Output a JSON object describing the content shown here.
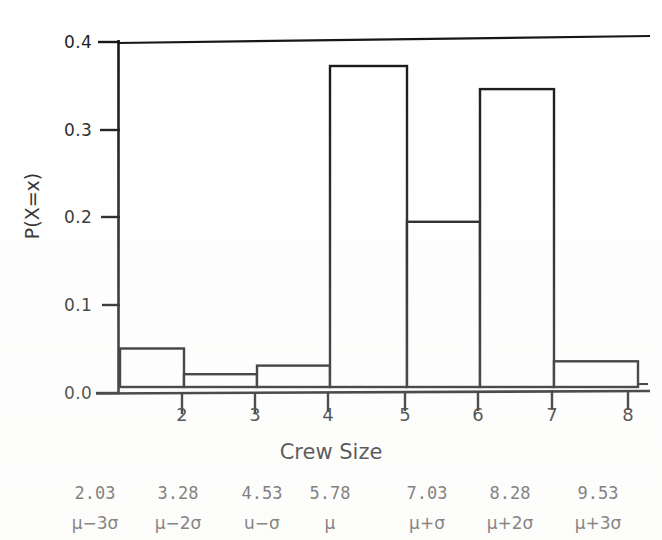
{
  "figure": {
    "kind": "statistics-textbook-figure",
    "ylabel": "P(X=x)",
    "xlabel": "Crew Size"
  },
  "axes": {
    "y_ticks": [
      "0.0",
      "0.1",
      "0.2",
      "0.3",
      "0.4"
    ],
    "x_ticks": [
      "2",
      "3",
      "4",
      "5",
      "6",
      "7",
      "8"
    ]
  },
  "annotations": {
    "values_row": [
      "2.03",
      "3.28",
      "4.53",
      "5.78",
      "7.03",
      "8.28",
      "9.53"
    ],
    "sigma_row": [
      "μ−3σ",
      "μ−2σ",
      "u−σ",
      "μ",
      "μ+σ",
      "μ+2σ",
      "μ+3σ"
    ]
  },
  "style": {
    "line_color": "#111111",
    "bar_fill": "#ffffff",
    "bar_stroke": "#111111",
    "text_color": "#1a1a1a",
    "annotation_color": "#4a4a4a",
    "background": "#ffffff"
  },
  "chart_data": {
    "type": "bar",
    "title": "",
    "subtitle": "",
    "xlabel": "Crew Size",
    "ylabel": "P(X=x)",
    "categories": [
      "2",
      "3",
      "4",
      "5",
      "6",
      "7",
      "8"
    ],
    "values": [
      0.045,
      0.015,
      0.025,
      0.375,
      0.193,
      0.348,
      0.03
    ],
    "ylim": [
      0.0,
      0.41
    ],
    "xlim": [
      1.5,
      8.0
    ],
    "yticks": [
      0.0,
      0.1,
      0.2,
      0.3,
      0.4
    ],
    "xticks": [
      2,
      3,
      4,
      5,
      6,
      7,
      8
    ],
    "grid": false,
    "legend": false,
    "bars_filled": false,
    "annotations": {
      "secondary_axis_values": [
        2.03,
        3.28,
        4.53,
        5.78,
        7.03,
        8.28,
        9.53
      ],
      "secondary_axis_labels": [
        "μ−3σ",
        "μ−2σ",
        "u−σ",
        "μ",
        "μ+σ",
        "μ+2σ",
        "μ+3σ"
      ]
    }
  },
  "geometry": {
    "plot_left": 118,
    "plot_right": 636,
    "plot_top": 42,
    "plot_bottom": 393,
    "y_value_max": 0.41,
    "tick_x_positions": [
      182,
      255,
      328,
      405,
      478,
      552,
      628
    ],
    "bar_edges": [
      [
        118,
        182
      ],
      [
        182,
        255
      ],
      [
        255,
        328
      ],
      [
        328,
        405
      ],
      [
        405,
        478
      ],
      [
        478,
        552
      ],
      [
        552,
        636
      ]
    ],
    "bar_tops": [
      350,
      380,
      371,
      63,
      222,
      88,
      367
    ],
    "ytick_y_positions": [
      393,
      305,
      217,
      130,
      42
    ],
    "annot_x_positions": [
      95,
      178,
      262,
      330,
      427,
      510,
      598
    ]
  }
}
